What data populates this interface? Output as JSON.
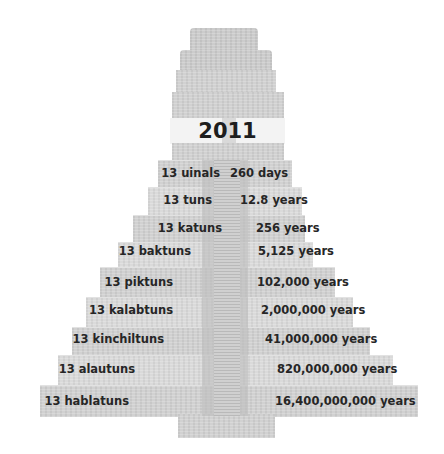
{
  "title_year": "2011",
  "rows": [
    {
      "unit": "13 uinals",
      "duration": "260 days"
    },
    {
      "unit": "13 tuns",
      "duration": "12.8 years"
    },
    {
      "unit": "13 katuns",
      "duration": "256 years"
    },
    {
      "unit": "13 baktuns",
      "duration": "5,125 years"
    },
    {
      "unit": "13 piktuns",
      "duration": "102,000 years"
    },
    {
      "unit": "13 kalabtuns",
      "duration": "2,000,000 years"
    },
    {
      "unit": "13 kinchiltuns",
      "duration": "41,000,000 years"
    },
    {
      "unit": "13 alautuns",
      "duration": "820,000,000 years"
    },
    {
      "unit": "13 hablatuns",
      "duration": "16,400,000,000 years"
    }
  ],
  "colors": {
    "stone": "#cfcfcf",
    "band": "#f3f3f3",
    "text": "#262626"
  }
}
